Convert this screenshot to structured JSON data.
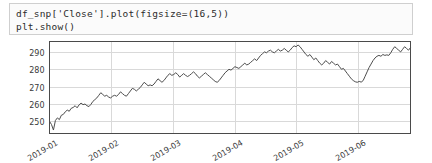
{
  "code_cell": {
    "lines": [
      "df_snp['Close'].plot(figsize=(16,5))",
      "plt.show()"
    ],
    "line1": "df_snp['Close'].plot(figsize=(16,5))",
    "line2": "plt.show()"
  },
  "colors": {
    "line": "#4d4d4d",
    "grid": "#d9d9d9",
    "axis": "#4a4a4a",
    "cell_bg": "#fbfbfb",
    "cell_border": "#cfcfcf",
    "tick_text": "#3a3a3a"
  },
  "chart_data": {
    "type": "line",
    "title": "",
    "xlabel": "",
    "ylabel": "",
    "grid": true,
    "legend": false,
    "ylim": [
      243,
      296
    ],
    "yticks": [
      250,
      260,
      270,
      280,
      290
    ],
    "ytick_labels": [
      "250",
      "260",
      "270",
      "280",
      "290"
    ],
    "xticks": [
      "2019-01",
      "2019-02",
      "2019-03",
      "2019-04",
      "2019-05",
      "2019-06"
    ],
    "xtick_labels": [
      "2019-01",
      "2019-02",
      "2019-03",
      "2019-04",
      "2019-05",
      "2019-06"
    ],
    "xtick_rotation": 30,
    "xlim": [
      "2019-01-01",
      "2019-06-25"
    ],
    "series": [
      {
        "name": "Close",
        "values": [
          250.0,
          248.2,
          245.0,
          250.5,
          252.0,
          251.0,
          253.5,
          254.0,
          255.5,
          256.5,
          255.8,
          257.5,
          258.0,
          259.0,
          257.8,
          259.5,
          260.5,
          259.6,
          260.0,
          259.0,
          258.5,
          259.8,
          261.5,
          262.5,
          263.5,
          265.0,
          266.5,
          265.5,
          264.5,
          265.0,
          264.0,
          263.5,
          264.5,
          265.0,
          264.5,
          265.5,
          267.0,
          266.0,
          265.0,
          264.5,
          266.0,
          267.5,
          269.0,
          268.5,
          267.5,
          268.5,
          269.5,
          271.0,
          272.5,
          271.5,
          270.5,
          271.0,
          270.5,
          271.5,
          273.0,
          274.5,
          273.5,
          272.5,
          273.5,
          275.0,
          276.5,
          277.5,
          276.5,
          277.0,
          278.0,
          277.0,
          275.5,
          276.5,
          277.5,
          276.5,
          275.8,
          276.5,
          277.5,
          278.5,
          277.5,
          276.0,
          275.0,
          276.0,
          277.0,
          278.0,
          277.0,
          276.0,
          275.0,
          274.0,
          273.0,
          272.5,
          273.5,
          275.0,
          276.5,
          278.0,
          279.0,
          280.0,
          279.5,
          280.5,
          281.5,
          281.0,
          280.5,
          281.5,
          282.5,
          283.5,
          282.5,
          283.0,
          284.0,
          285.0,
          286.0,
          285.0,
          286.5,
          288.0,
          289.0,
          290.0,
          289.5,
          290.5,
          291.0,
          290.0,
          289.5,
          290.5,
          291.5,
          290.5,
          291.0,
          292.0,
          291.0,
          290.0,
          291.0,
          292.5,
          293.5,
          293.0,
          294.0,
          293.0,
          291.5,
          290.0,
          288.5,
          287.5,
          288.5,
          287.0,
          285.5,
          286.5,
          285.0,
          283.5,
          282.5,
          283.5,
          285.0,
          284.0,
          283.0,
          284.5,
          283.5,
          282.5,
          283.0,
          281.5,
          280.0,
          280.5,
          279.0,
          277.5,
          276.0,
          274.5,
          273.5,
          272.8,
          272.5,
          273.0,
          272.6,
          273.5,
          276.0,
          278.5,
          281.0,
          283.0,
          285.0,
          286.5,
          287.5,
          288.0,
          287.5,
          288.5,
          288.0,
          288.3,
          288.0,
          289.5,
          291.5,
          293.0,
          292.0,
          291.0,
          290.0,
          291.5,
          293.0,
          292.0,
          291.0,
          292.5
        ]
      }
    ]
  }
}
